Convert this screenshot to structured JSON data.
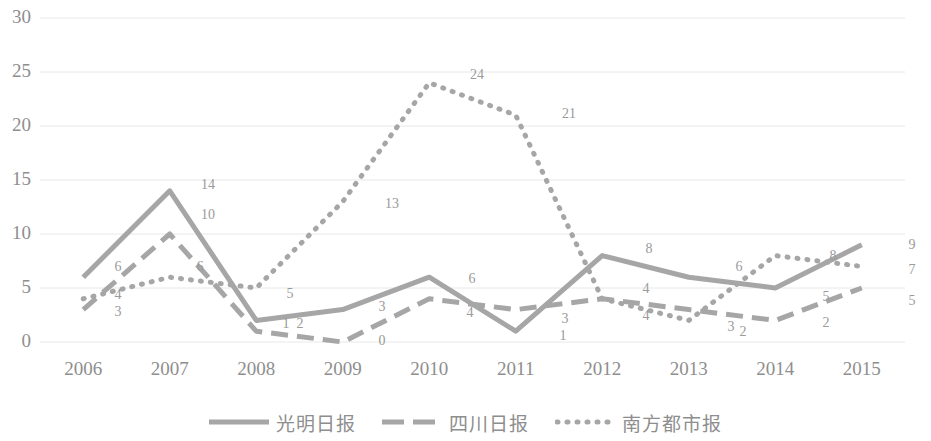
{
  "chart_data": {
    "type": "line",
    "title": "",
    "xlabel": "",
    "ylabel": "",
    "ylim": [
      0,
      30
    ],
    "yticks": [
      0,
      5,
      10,
      15,
      20,
      25,
      30
    ],
    "grid": true,
    "legend_position": "bottom",
    "categories": [
      "2006",
      "2007",
      "2008",
      "2009",
      "2010",
      "2011",
      "2012",
      "2013",
      "2014",
      "2015"
    ],
    "series": [
      {
        "name": "光明日报",
        "style": "solid",
        "color": "#a6a6a6",
        "values": [
          6,
          14,
          2,
          3,
          6,
          1,
          8,
          6,
          5,
          9
        ]
      },
      {
        "name": "四川日报",
        "style": "dashed",
        "color": "#a6a6a6",
        "values": [
          3,
          10,
          1,
          0,
          4,
          3,
          4,
          3,
          2,
          5
        ]
      },
      {
        "name": "南方都市报",
        "style": "dotted",
        "color": "#a6a6a6",
        "values": [
          4,
          6,
          5,
          13,
          24,
          21,
          4,
          2,
          8,
          7
        ]
      }
    ]
  },
  "axis": {
    "y_tick_labels": [
      "30",
      "25",
      "20",
      "15",
      "10",
      "5",
      "0"
    ],
    "x_tick_labels": [
      "2006",
      "2007",
      "2008",
      "2009",
      "2010",
      "2011",
      "2012",
      "2013",
      "2014",
      "2015"
    ]
  },
  "point_labels": [
    {
      "text": "6",
      "x": 118,
      "y": 268
    },
    {
      "text": "4",
      "x": 118,
      "y": 296
    },
    {
      "text": "3",
      "x": 118,
      "y": 313
    },
    {
      "text": "14",
      "x": 208,
      "y": 186
    },
    {
      "text": "10",
      "x": 208,
      "y": 216
    },
    {
      "text": "6",
      "x": 200,
      "y": 268
    },
    {
      "text": "5",
      "x": 290,
      "y": 295
    },
    {
      "text": "1",
      "x": 286,
      "y": 325
    },
    {
      "text": "2",
      "x": 300,
      "y": 325
    },
    {
      "text": "13",
      "x": 392,
      "y": 205
    },
    {
      "text": "3",
      "x": 382,
      "y": 308
    },
    {
      "text": "0",
      "x": 382,
      "y": 342
    },
    {
      "text": "24",
      "x": 477,
      "y": 76
    },
    {
      "text": "6",
      "x": 472,
      "y": 280
    },
    {
      "text": "4",
      "x": 470,
      "y": 314
    },
    {
      "text": "21",
      "x": 569,
      "y": 115
    },
    {
      "text": "3",
      "x": 565,
      "y": 320
    },
    {
      "text": "1",
      "x": 563,
      "y": 337
    },
    {
      "text": "8",
      "x": 649,
      "y": 250
    },
    {
      "text": "4",
      "x": 646,
      "y": 290
    },
    {
      "text": "4",
      "x": 646,
      "y": 317
    },
    {
      "text": "6",
      "x": 739,
      "y": 268
    },
    {
      "text": "3",
      "x": 731,
      "y": 328
    },
    {
      "text": "2",
      "x": 743,
      "y": 333
    },
    {
      "text": "8",
      "x": 833,
      "y": 257
    },
    {
      "text": "5",
      "x": 826,
      "y": 298
    },
    {
      "text": "2",
      "x": 826,
      "y": 324
    },
    {
      "text": "9",
      "x": 912,
      "y": 246
    },
    {
      "text": "7",
      "x": 912,
      "y": 271
    },
    {
      "text": "5",
      "x": 912,
      "y": 302
    }
  ],
  "legend": {
    "items": [
      {
        "label": "光明日报",
        "style": "solid"
      },
      {
        "label": "四川日报",
        "style": "dashed"
      },
      {
        "label": "南方都市报",
        "style": "dotted"
      }
    ]
  }
}
